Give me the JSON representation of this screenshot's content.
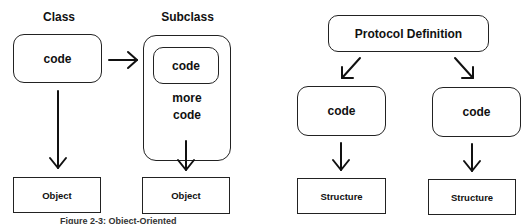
{
  "left_diagram": {
    "class_label": "Class",
    "subclass_label": "Subclass",
    "class_box_text": "code",
    "subclass_inner_text": "code",
    "subclass_more_line1": "more",
    "subclass_more_line2": "code",
    "object_left": "Object",
    "object_right": "Object"
  },
  "right_diagram": {
    "protocol_label": "Protocol Definition",
    "code_left": "code",
    "code_right": "code",
    "structure_left": "Structure",
    "structure_right": "Structure"
  },
  "caption": "Figure 2-3: Object-Oriented"
}
